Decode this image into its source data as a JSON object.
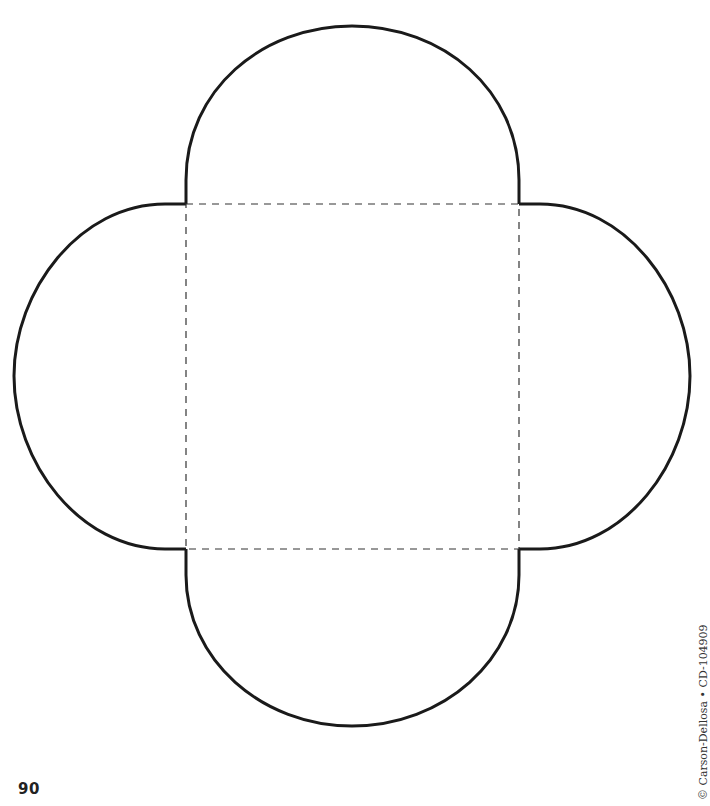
{
  "page": {
    "number": "90",
    "copyright": "© Carson-Dellosa • CD-104909"
  },
  "template": {
    "shape": "four-flap envelope pattern",
    "outline_color": "#1a1a1a",
    "fold_line_color": "#333333",
    "fold_square": {
      "x1": 186,
      "y1": 204,
      "x2": 519,
      "y2": 549
    },
    "flaps": [
      "top",
      "right",
      "bottom",
      "left"
    ]
  }
}
